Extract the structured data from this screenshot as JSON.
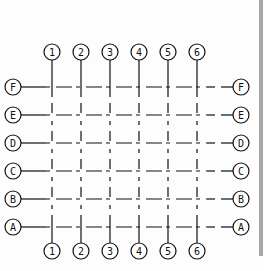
{
  "diagram": {
    "line_color": "#111111",
    "columns": [
      {
        "label": "1",
        "x": 52
      },
      {
        "label": "2",
        "x": 81
      },
      {
        "label": "3",
        "x": 110
      },
      {
        "label": "4",
        "x": 139
      },
      {
        "label": "5",
        "x": 168
      },
      {
        "label": "6",
        "x": 197
      }
    ],
    "rows": [
      {
        "label": "F",
        "y": 87
      },
      {
        "label": "E",
        "y": 115
      },
      {
        "label": "D",
        "y": 143
      },
      {
        "label": "C",
        "y": 171
      },
      {
        "label": "B",
        "y": 199
      },
      {
        "label": "A",
        "y": 227
      }
    ],
    "top_bubble_y": 52,
    "bottom_bubble_y": 251,
    "left_bubble_x": 13,
    "right_bubble_x": 241,
    "bubble_radius": 8
  },
  "scrollbar": {
    "color": "#a6a6a6"
  }
}
